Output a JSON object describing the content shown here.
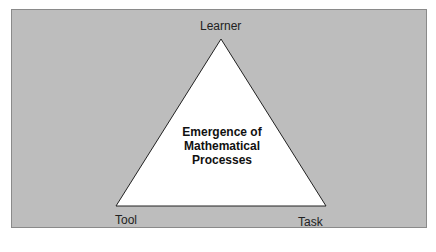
{
  "diagram": {
    "vertices": {
      "top": "Learner",
      "bottom_left": "Tool",
      "bottom_right": "Task"
    },
    "center_lines": [
      "Emergence of",
      "Mathematical",
      "Processes"
    ],
    "colors": {
      "panel": "#bdbdbd",
      "triangle_fill": "#ffffff",
      "stroke": "#222222"
    }
  }
}
